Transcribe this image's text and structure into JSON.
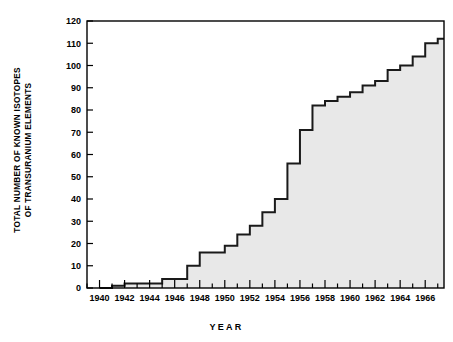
{
  "chart_data": {
    "type": "area",
    "title": "",
    "xlabel": "YEAR",
    "ylabel": "TOTAL NUMBER OF KNOWN ISOTOPES OF TRANSURANIUM ELEMENTS",
    "ylabel_line1": "TOTAL NUMBER OF KNOWN ISOTOPES",
    "ylabel_line2": "OF TRANSURANIUM ELEMENTS",
    "xlim": [
      1939,
      1967.5
    ],
    "ylim": [
      0,
      120
    ],
    "grid": false,
    "legend": false,
    "step_style": "post",
    "fill_color": "#e8e8e8",
    "line_color": "#1a1a1a",
    "y_ticks": [
      0,
      10,
      20,
      30,
      40,
      50,
      60,
      70,
      80,
      90,
      100,
      110,
      120
    ],
    "y_tick_labels": [
      "0",
      "10",
      "20",
      "30",
      "40",
      "50",
      "60",
      "70",
      "80",
      "90",
      "100",
      "110",
      "120"
    ],
    "x_ticks_major": [
      1940,
      1942,
      1944,
      1946,
      1948,
      1950,
      1952,
      1954,
      1956,
      1958,
      1960,
      1962,
      1964,
      1966
    ],
    "x_tick_labels": [
      "1940",
      "1942",
      "1944",
      "1946",
      "1948",
      "1950",
      "1952",
      "1954",
      "1956",
      "1958",
      "1960",
      "1962",
      "1964",
      "1966"
    ],
    "x_minor_tick_step": 1,
    "x": [
      1940,
      1941,
      1942,
      1943,
      1944,
      1945,
      1946,
      1947,
      1948,
      1949,
      1950,
      1951,
      1952,
      1953,
      1954,
      1955,
      1956,
      1957,
      1958,
      1959,
      1960,
      1961,
      1962,
      1963,
      1964,
      1965,
      1966,
      1967
    ],
    "values": [
      0,
      1,
      2,
      2,
      2,
      4,
      4,
      10,
      16,
      16,
      19,
      24,
      28,
      34,
      40,
      56,
      71,
      82,
      84,
      86,
      88,
      91,
      93,
      98,
      100,
      104,
      110,
      112
    ],
    "categories": [
      "1940",
      "1941",
      "1942",
      "1943",
      "1944",
      "1945",
      "1946",
      "1947",
      "1948",
      "1949",
      "1950",
      "1951",
      "1952",
      "1953",
      "1954",
      "1955",
      "1956",
      "1957",
      "1958",
      "1959",
      "1960",
      "1961",
      "1962",
      "1963",
      "1964",
      "1965",
      "1966",
      "1967"
    ],
    "series": [
      {
        "name": "Total known isotopes of transuranium elements",
        "values": [
          0,
          1,
          2,
          2,
          2,
          4,
          4,
          10,
          16,
          16,
          19,
          24,
          28,
          34,
          40,
          56,
          71,
          82,
          84,
          86,
          88,
          91,
          93,
          98,
          100,
          104,
          110,
          112
        ]
      }
    ]
  }
}
